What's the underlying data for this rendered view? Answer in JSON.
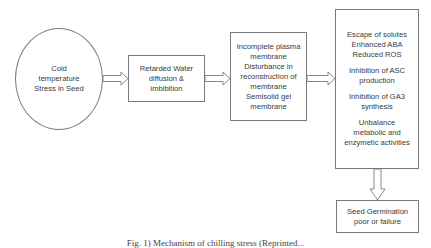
{
  "diagram": {
    "nodes": [
      {
        "id": "cold-stress",
        "shape": "ellipse",
        "lines": [
          "Cold",
          "temperature",
          "Stress in Seed"
        ]
      },
      {
        "id": "water-diffusion",
        "shape": "rect",
        "lines": [
          "Retarded Water",
          "diffusion &",
          "imbibition"
        ]
      },
      {
        "id": "membrane",
        "shape": "rect",
        "lines": [
          "Incomplete plasma",
          "membrane",
          "Disturbance in",
          "reconstruction of",
          "membrane",
          "Semisolid gel",
          "membrane"
        ]
      },
      {
        "id": "effects",
        "shape": "rect",
        "groups": [
          [
            "Escape of solutes",
            "Enhanced ABA",
            "Reduced ROS"
          ],
          [
            "Inhibition of ASC",
            "production"
          ],
          [
            "Inhibition of GA3",
            "synthesis"
          ],
          [
            "Unbalance",
            "metabolic and",
            "enzymetic activities"
          ]
        ]
      },
      {
        "id": "outcome",
        "shape": "rect",
        "lines": [
          "Seed Germination",
          "poor or failure"
        ]
      }
    ],
    "edges": [
      {
        "from": "cold-stress",
        "to": "water-diffusion"
      },
      {
        "from": "water-diffusion",
        "to": "membrane"
      },
      {
        "from": "membrane",
        "to": "effects"
      },
      {
        "from": "effects",
        "to": "outcome"
      }
    ],
    "caption": "Fig. 1) Mechanism of chilling stress (Reprinted..."
  },
  "colors": {
    "stroke": "#7a7a7a",
    "text": "#3a3a3a",
    "background": "#ffffff"
  }
}
